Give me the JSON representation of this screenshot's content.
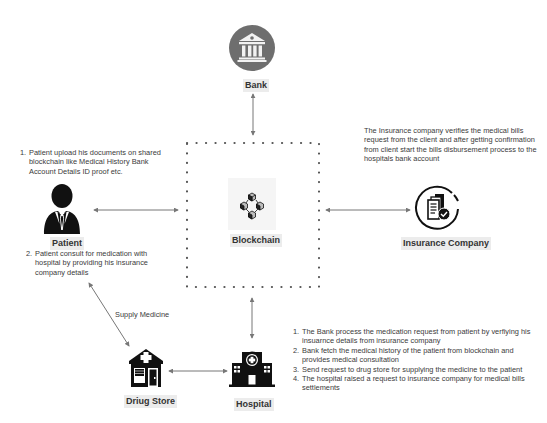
{
  "nodes": {
    "bank": {
      "label": "Bank",
      "icon": "bank-icon",
      "color": "#6e6e6e"
    },
    "patient": {
      "label": "Patient",
      "icon": "person-icon"
    },
    "blockchain": {
      "label": "Blockchain",
      "icon": "blockchain-icon"
    },
    "insurance": {
      "label": "Insurance Company",
      "icon": "insurance-document-icon"
    },
    "drug_store": {
      "label": "Driug Store",
      "icon": "pharmacy-icon"
    },
    "hospital": {
      "label": "Hospital",
      "icon": "hospital-icon"
    }
  },
  "edges": [
    {
      "from": "bank",
      "to": "blockchain",
      "bidirectional": true
    },
    {
      "from": "patient",
      "to": "blockchain",
      "bidirectional": true
    },
    {
      "from": "insurance",
      "to": "blockchain",
      "bidirectional": true
    },
    {
      "from": "blockchain",
      "to": "hospital",
      "bidirectional": true
    },
    {
      "from": "drug_store",
      "to": "hospital",
      "bidirectional": true
    },
    {
      "from": "patient",
      "to": "drug_store",
      "bidirectional": true,
      "label": "Supply Medicine"
    }
  ],
  "edge_labels": {
    "supply_medicine": "Supply Medicine"
  },
  "notes": {
    "patient_top": [
      {
        "num": "1.",
        "text": "Patient upload his documents on shared blockchain like Medical History Bank Account Details ID proof etc."
      }
    ],
    "patient_bottom": [
      {
        "num": "2.",
        "text": "Patient consult for medication with hospital by providing his insurance company details"
      }
    ],
    "insurance": "The Insurance company verifies the medical bills request from the client and after getting confirmation from client start the bills disbursement process to the hospitals bank account",
    "hospital": [
      {
        "num": "1.",
        "text": "The Bank process the medication request from patient by verfiying his insuarnce details from insurance company"
      },
      {
        "num": "2.",
        "text": "Bank fetch the medical history of the patient from blockchain and provides medical consultation"
      },
      {
        "num": "3.",
        "text": "Send request to drug store for supplying the medicine to the patient"
      },
      {
        "num": "4.",
        "text": "The hospital raised a request to insurance company for medical bills settlements"
      }
    ]
  },
  "colors": {
    "arrow": "#777777",
    "dots": "#555555",
    "icon": "#111111",
    "label_bg": "#ececec"
  }
}
